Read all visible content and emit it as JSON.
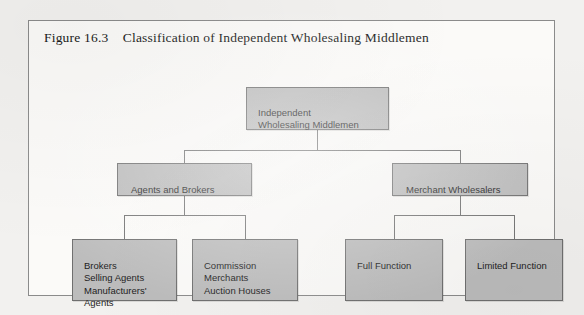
{
  "figure": {
    "title": "Figure 16.3    Classification of Independent Wholesaling Middlemen"
  },
  "chart_data": {
    "type": "diagram",
    "title": "Figure 16.3    Classification of Independent Wholesaling Middlemen",
    "diagram_kind": "hierarchy-tree",
    "orientation": "top-down",
    "levels": 3,
    "node_fill_color": "#bcbcbc",
    "node_border_color": "#6f6f6f",
    "connector_color": "#717171",
    "page_background_color": "#f2f1ef",
    "frame_background_color": "#fbfaf8",
    "nodes": [
      {
        "id": "root",
        "label": "Independent\nWholesaling  Middlemen",
        "level": 1,
        "parent": null
      },
      {
        "id": "agents_brokers",
        "label": "Agents and Brokers",
        "level": 2,
        "parent": "root"
      },
      {
        "id": "merchant_wholesalers",
        "label": "Merchant Wholesalers",
        "level": 2,
        "parent": "root"
      },
      {
        "id": "brokers_group",
        "label": "Brokers\nSelling Agents\nManufacturers'\n  Agents",
        "level": 3,
        "parent": "agents_brokers"
      },
      {
        "id": "commission_group",
        "label": "Commission\n  Merchants\nAuction Houses",
        "level": 3,
        "parent": "agents_brokers"
      },
      {
        "id": "full_function",
        "label": "Full Function",
        "level": 3,
        "parent": "merchant_wholesalers"
      },
      {
        "id": "limited_function",
        "label": "Limited Function",
        "level": 3,
        "parent": "merchant_wholesalers"
      }
    ],
    "edges": [
      {
        "from": "root",
        "to": "agents_brokers"
      },
      {
        "from": "root",
        "to": "merchant_wholesalers"
      },
      {
        "from": "agents_brokers",
        "to": "brokers_group"
      },
      {
        "from": "agents_brokers",
        "to": "commission_group"
      },
      {
        "from": "merchant_wholesalers",
        "to": "full_function"
      },
      {
        "from": "merchant_wholesalers",
        "to": "limited_function"
      }
    ]
  }
}
